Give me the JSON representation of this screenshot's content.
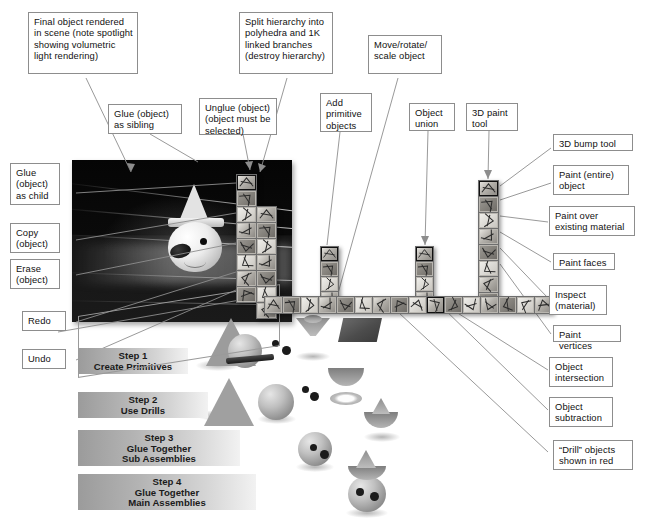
{
  "figure": {
    "accent_color": "#8d8d8d",
    "background_color": "#ffffff",
    "text_color": "#111111"
  },
  "callouts": [
    {
      "id": "final-object",
      "text": "Final object rendered in scene (note spotlight showing volumetric light rendering)"
    },
    {
      "id": "split-hierarchy",
      "text": "Split hierarchy into polyhedra and 1K linked branches (destroy hierarchy)"
    },
    {
      "id": "move-rotate-scale",
      "text": "Move/rotate/ scale object"
    },
    {
      "id": "glue-sibling",
      "text": "Glue (object) as sibling"
    },
    {
      "id": "unglue",
      "text": "Unglue (object) (object must be selected)"
    },
    {
      "id": "add-primitive",
      "text": "Add primitive objects"
    },
    {
      "id": "object-union",
      "text": "Object union"
    },
    {
      "id": "paint-tool-3d",
      "text": "3D paint tool"
    },
    {
      "id": "bump-tool-3d",
      "text": "3D bump tool"
    },
    {
      "id": "glue-child",
      "text": "Glue (object) as child"
    },
    {
      "id": "paint-entire",
      "text": "Paint (entire) object"
    },
    {
      "id": "copy-object",
      "text": "Copy (object)"
    },
    {
      "id": "paint-over",
      "text": "Paint over existing material"
    },
    {
      "id": "erase-object",
      "text": "Erase (object)"
    },
    {
      "id": "paint-faces",
      "text": "Paint faces"
    },
    {
      "id": "redo",
      "text": "Redo"
    },
    {
      "id": "inspect-material",
      "text": "Inspect (material)"
    },
    {
      "id": "undo",
      "text": "Undo"
    },
    {
      "id": "paint-vertices",
      "text": "Paint vertices"
    },
    {
      "id": "object-intersect",
      "text": "Object intersection"
    },
    {
      "id": "object-subtract",
      "text": "Object subtraction"
    },
    {
      "id": "drill-red",
      "text": "“Drill” objects shown in red"
    }
  ],
  "steps": [
    {
      "id": "step-1",
      "lines": [
        "Step 1",
        "Create Primitives"
      ]
    },
    {
      "id": "step-2",
      "lines": [
        "Step 2",
        "Use Drills"
      ]
    },
    {
      "id": "step-3",
      "lines": [
        "Step 3",
        "Glue Together",
        "Sub Assemblies"
      ]
    },
    {
      "id": "step-4",
      "lines": [
        "Step 4",
        "Glue Together",
        "Main Assemblies"
      ]
    }
  ],
  "palettes": [
    {
      "id": "hierarchy-palette",
      "name": "hierarchy-tools",
      "count": 8,
      "selected": 0
    },
    {
      "id": "glue-palette",
      "name": "glue-tools",
      "count": 7,
      "selected": -1
    },
    {
      "id": "primitive-palette",
      "name": "primitive-tools",
      "count": 4,
      "selected": 0
    },
    {
      "id": "boolean-palette",
      "name": "boolean-tools",
      "count": 4,
      "selected": 0
    },
    {
      "id": "paint-palette",
      "name": "paint-tools",
      "count": 8,
      "selected": 0
    },
    {
      "id": "main-toolbar",
      "name": "main-toolbar",
      "count": 16,
      "selected": 9
    }
  ],
  "render_scene": {
    "id": "render-viewport",
    "description": "Dark rendered 3D scene with clown-head model and volumetric spotlight beams"
  }
}
